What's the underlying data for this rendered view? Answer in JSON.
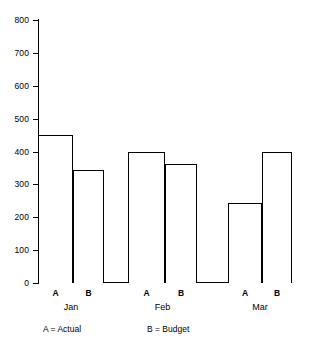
{
  "chart_data": {
    "type": "bar",
    "title": "",
    "subtitle": "",
    "xlabel": "",
    "ylabel": "",
    "ylim": [
      0,
      800
    ],
    "ytick_step": 100,
    "grid": false,
    "legend_position": "below-axis",
    "categories": [
      "Jan",
      "Feb",
      "Mar"
    ],
    "bar_labels": [
      "A",
      "B"
    ],
    "ytick_labels": [
      "800",
      "700",
      "600",
      "500",
      "400",
      "300",
      "200",
      "100",
      "0"
    ],
    "ytick_values": [
      800,
      700,
      600,
      500,
      400,
      300,
      200,
      100,
      0
    ],
    "series": [
      {
        "name": "A = Actual",
        "key": "A",
        "values": [
          450,
          400,
          243
        ]
      },
      {
        "name": "B = Budget",
        "key": "B",
        "values": [
          345,
          363,
          400
        ]
      }
    ],
    "bars": [
      {
        "group": "Jan",
        "label": "A",
        "value": 450
      },
      {
        "group": "Jan",
        "label": "B",
        "value": 345
      },
      {
        "group": "Feb",
        "label": "A",
        "value": 400
      },
      {
        "group": "Feb",
        "label": "B",
        "value": 363
      },
      {
        "group": "Mar",
        "label": "A",
        "value": 243
      },
      {
        "group": "Mar",
        "label": "B",
        "value": 400
      }
    ],
    "legend": [
      {
        "text": "A = Actual"
      },
      {
        "text": "B = Budget"
      }
    ],
    "colors": {
      "axis": "#000000",
      "bar_outline": "#000000",
      "bar_fill": "#ffffff",
      "background": "#ffffff",
      "text": "#000000"
    }
  },
  "axis": {
    "ticks": [
      {
        "label": "800",
        "value": 800
      },
      {
        "label": "700",
        "value": 700
      },
      {
        "label": "600",
        "value": 600
      },
      {
        "label": "500",
        "value": 500
      },
      {
        "label": "400",
        "value": 400
      },
      {
        "label": "300",
        "value": 300
      },
      {
        "label": "200",
        "value": 200
      },
      {
        "label": "100",
        "value": 100
      },
      {
        "label": "0",
        "value": 0
      }
    ]
  },
  "xaxis": {
    "bar_labels": [
      "A",
      "B",
      "A",
      "B",
      "A",
      "B"
    ],
    "group_labels": [
      "Jan",
      "Feb",
      "Mar"
    ]
  },
  "legend": {
    "items": [
      "A = Actual",
      "B = Budget"
    ]
  }
}
